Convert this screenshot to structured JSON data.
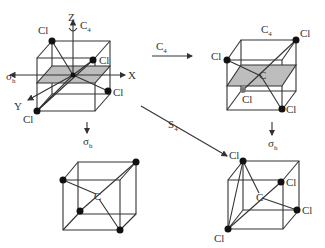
{
  "diagram": {
    "panels": [
      {
        "id": "original",
        "atoms": [
          "Cl",
          "Cl",
          "Cl",
          "Cl"
        ],
        "center": "",
        "axes": [
          "Z",
          "X",
          "Y"
        ],
        "axis_symbol": "C4",
        "plane": "σh"
      },
      {
        "id": "after-c4",
        "title": "C4",
        "atoms": [
          "Cl",
          "Cl",
          "Cl",
          "Cl"
        ],
        "center": "C"
      },
      {
        "id": "after-sigma-h",
        "atoms": [],
        "center": "C"
      },
      {
        "id": "after-s4",
        "atoms": [
          "Cl",
          "Cl",
          "Cl",
          "Cl"
        ],
        "center": "C"
      }
    ],
    "arrows": [
      {
        "id": "c4-arrow",
        "label": "C",
        "sub": "4"
      },
      {
        "id": "sigma-h-left-arrow",
        "label": "σ",
        "sub": "h"
      },
      {
        "id": "s4-arrow",
        "label": "S",
        "sub": "4"
      },
      {
        "id": "sigma-h-right-arrow",
        "label": "σ",
        "sub": "h"
      }
    ],
    "labels": {
      "cl": "Cl",
      "c": "C",
      "z": "Z",
      "x": "X",
      "y": "Y",
      "c_main": "C",
      "sub4": "4",
      "sigma": "σ",
      "sub_h": "h",
      "s_main": "S"
    }
  }
}
